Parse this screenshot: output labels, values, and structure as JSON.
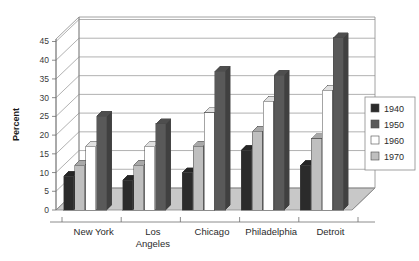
{
  "chart_data": {
    "type": "bar",
    "title": "",
    "subtitle": "",
    "xlabel": "",
    "ylabel": "Percent",
    "ylim": [
      0,
      47
    ],
    "yticks": [
      0,
      5,
      10,
      15,
      20,
      25,
      30,
      35,
      40,
      45
    ],
    "ytick_labels": [
      "0",
      "5",
      "10",
      "15",
      "20",
      "25",
      "30",
      "35",
      "40",
      "45"
    ],
    "grid": true,
    "three_d": true,
    "legend_position": "right",
    "categories": [
      "New York",
      "Los Angeles",
      "Chicago",
      "Philadelphia",
      "Detroit"
    ],
    "category_lines": [
      [
        "New York"
      ],
      [
        "Los",
        "Angeles"
      ],
      [
        "Chicago"
      ],
      [
        "Philadelphia"
      ],
      [
        "Detroit"
      ]
    ],
    "series": [
      {
        "name": "1940",
        "color": "#2b2b2b",
        "values": [
          9,
          8,
          10,
          16,
          12
        ]
      },
      {
        "name": "1950",
        "color": "#bfbfbf",
        "values": [
          12,
          12,
          17,
          21,
          19
        ]
      },
      {
        "name": "1960",
        "color": "#ffffff",
        "values": [
          17,
          17,
          26,
          29,
          32
        ]
      },
      {
        "name": "1970",
        "color": "#595959",
        "values": [
          25,
          23,
          37,
          36,
          46
        ]
      }
    ]
  },
  "legend": {
    "items": [
      {
        "label": "1940",
        "swatch": "#2b2b2b"
      },
      {
        "label": "1950",
        "swatch": "#595959"
      },
      {
        "label": "1960",
        "swatch": "#ffffff"
      },
      {
        "label": "1970",
        "swatch": "#bfbfbf"
      }
    ]
  },
  "axis": {
    "y_title": "Percent",
    "y_tick_labels": [
      "0",
      "5",
      "10",
      "15",
      "20",
      "25",
      "30",
      "35",
      "40",
      "45"
    ]
  },
  "colors": {
    "floor": "#c8c8c8",
    "grid": "#8f8f8f",
    "frame": "#8a8a8a",
    "background": "#ffffff",
    "text": "#2b2b2b"
  }
}
